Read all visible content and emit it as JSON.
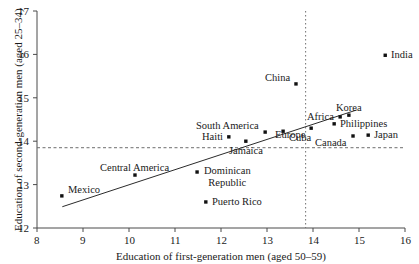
{
  "chart_data": {
    "type": "scatter",
    "title": "",
    "xlabel": "Education of first-generation men (aged 50–59)",
    "ylabel": "Education of second-generation men (aged 25–34)",
    "xlim": [
      8,
      16
    ],
    "ylim": [
      12,
      17
    ],
    "xticks": [
      8,
      9,
      10,
      11,
      12,
      13,
      14,
      15,
      16
    ],
    "yticks": [
      12,
      13,
      14,
      15,
      16,
      17
    ],
    "xtick_labels": [
      "8",
      "9",
      "10",
      "11",
      "12",
      "13",
      "14",
      "15",
      "16"
    ],
    "ytick_labels": [
      "12",
      "13",
      "14",
      "15",
      "16",
      "17"
    ],
    "grid": false,
    "legend": null,
    "reference_lines": [
      {
        "name": "mean-first-generation-education",
        "orientation": "vertical",
        "value": 13.84,
        "style": "dotted"
      },
      {
        "name": "mean-second-generation-education",
        "orientation": "horizontal",
        "value": 13.85,
        "style": "dashed"
      }
    ],
    "trend_line": {
      "name": "fitted-regression-line",
      "x": [
        8.55,
        14.95
      ],
      "y": [
        12.49,
        14.72
      ],
      "style": "solid"
    },
    "points": [
      {
        "label": "Mexico",
        "x": 8.54,
        "y": 12.74,
        "label_pos": "above-right"
      },
      {
        "label": "Central America",
        "x": 10.13,
        "y": 13.22,
        "label_pos": "above"
      },
      {
        "label": "Dominican Republic",
        "x": 11.48,
        "y": 13.29,
        "label_pos": "right-two-line"
      },
      {
        "label": "Puerto Rico",
        "x": 11.67,
        "y": 12.6,
        "label_pos": "right"
      },
      {
        "label": "Haiti",
        "x": 12.17,
        "y": 14.1,
        "label_pos": "left"
      },
      {
        "label": "Jamaica",
        "x": 12.54,
        "y": 14.0,
        "label_pos": "below"
      },
      {
        "label": "South America",
        "x": 12.96,
        "y": 14.21,
        "label_pos": "above-left"
      },
      {
        "label": "Cuba",
        "x": 13.35,
        "y": 14.23,
        "label_pos": "below-right"
      },
      {
        "label": "China",
        "x": 13.63,
        "y": 15.32,
        "label_pos": "above-left"
      },
      {
        "label": "Europe",
        "x": 13.96,
        "y": 14.3,
        "label_pos": "below-left"
      },
      {
        "label": "Philippines",
        "x": 14.46,
        "y": 14.4,
        "label_pos": "right"
      },
      {
        "label": "Africa",
        "x": 14.59,
        "y": 14.56,
        "label_pos": "left"
      },
      {
        "label": "Korea",
        "x": 14.78,
        "y": 14.6,
        "label_pos": "above"
      },
      {
        "label": "Canada",
        "x": 14.87,
        "y": 14.12,
        "label_pos": "below-left"
      },
      {
        "label": "Japan",
        "x": 15.2,
        "y": 14.14,
        "label_pos": "right"
      },
      {
        "label": "India",
        "x": 15.57,
        "y": 15.98,
        "label_pos": "right"
      }
    ]
  }
}
